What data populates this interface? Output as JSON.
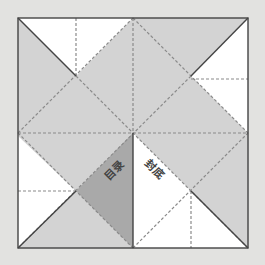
{
  "diagram": {
    "type": "fold-pattern",
    "colors": {
      "background": "#e2e2e0",
      "paper": "#ffffff",
      "light_region": "#d3d3d3",
      "dark_region": "#a9a9a9",
      "solid_line": "#444444",
      "dashed_line": "#8a8a8a"
    },
    "labels": {
      "contents": "目录",
      "back_cover": "封底"
    }
  }
}
